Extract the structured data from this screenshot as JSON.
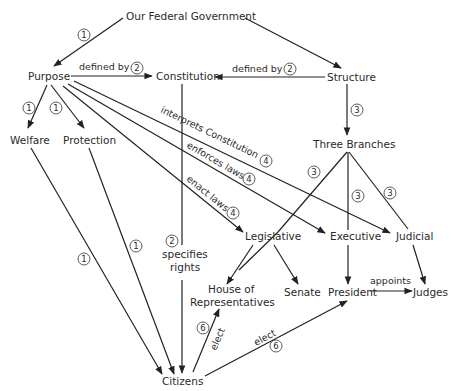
{
  "diagram": {
    "title": "Our Federal Government",
    "nodes": {
      "government": "Our Federal Government",
      "purpose": "Purpose",
      "constitution": "Constitution",
      "structure": "Structure",
      "welfare": "Welfare",
      "protection": "Protection",
      "three_branches": "Three Branches",
      "legislative": "Legislative",
      "executive": "Executive",
      "judicial": "Judicial",
      "house_line1": "House of",
      "house_line2": "Representatives",
      "senate": "Senate",
      "president": "President",
      "judges": "Judges",
      "citizens": "Citizens",
      "specifies_line1": "specifies",
      "specifies_line2": "rights"
    },
    "edge_labels": {
      "purpose_constitution": "defined by",
      "structure_constitution": "defined by",
      "interprets": "interprets Constitution",
      "enforces": "enforces laws",
      "enact": "enact laws",
      "appoints": "appoints",
      "elect_house": "elect",
      "elect_president": "elect"
    },
    "badges": {
      "gov_purpose": "1",
      "purpose_welfare": "1",
      "purpose_protection": "1",
      "welfare_citizens": "1",
      "protection_citizens": "1",
      "purpose_constitution": "2",
      "structure_constitution": "2",
      "specifies": "2",
      "structure_branches": "3",
      "branches_legislative": "3",
      "branches_executive": "3",
      "branches_judicial": "3",
      "interprets": "4",
      "enforces": "4",
      "enact": "4",
      "elect_house": "6",
      "elect_president": "6"
    }
  }
}
